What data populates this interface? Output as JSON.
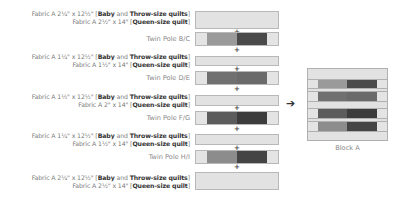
{
  "diagram": {
    "rows": [
      {
        "type": "fabric",
        "line1": {
          "prefix": "Fabric A 2¼\" x 12½\" [",
          "b1": "Baby",
          "mid": " and ",
          "b2": "Throw-size quilts",
          "suffix": "]"
        },
        "line2": {
          "prefix": "Fabric A 2½\" x 14\" [",
          "b1": "Queen-size quilt",
          "suffix": "]"
        }
      },
      {
        "type": "pole",
        "label": "Twin Pole B/C",
        "colors": {
          "mid": "#9a9a9a",
          "dark": "#4a4a4a"
        }
      },
      {
        "type": "fabric",
        "line1": {
          "prefix": "Fabric A 1¼\" x 12½\" [",
          "b1": "Baby",
          "mid": " and ",
          "b2": "Throw-size quilts",
          "suffix": "]"
        },
        "line2": {
          "prefix": "Fabric A 1½\" x 14\" [",
          "b1": "Queen-size quilt",
          "suffix": "]"
        }
      },
      {
        "type": "pole",
        "label": "Twin Pole D/E",
        "colors": {
          "mid": "#707070",
          "dark": "#6a6a6a"
        }
      },
      {
        "type": "fabric",
        "line1": {
          "prefix": "Fabric A 1½\" x 12½\" [",
          "b1": "Baby",
          "mid": " and ",
          "b2": "Throw-size quilts",
          "suffix": "]"
        },
        "line2": {
          "prefix": "Fabric A 2\" x 14\" [",
          "b1": "Queen-size quilt",
          "suffix": "]"
        }
      },
      {
        "type": "pole",
        "label": "Twin Pole F/G",
        "colors": {
          "mid": "#5c5c5c",
          "dark": "#3c3c3c"
        }
      },
      {
        "type": "fabric",
        "line1": {
          "prefix": "Fabric A 1¼\" x 12½\" [",
          "b1": "Baby",
          "mid": " and ",
          "b2": "Throw-size quilts",
          "suffix": "]"
        },
        "line2": {
          "prefix": "Fabric A 1½\" x 14\" [",
          "b1": "Queen-size quilt",
          "suffix": "]"
        }
      },
      {
        "type": "pole",
        "label": "Twin Pole H/I",
        "colors": {
          "mid": "#8c8c8c",
          "dark": "#444444"
        }
      },
      {
        "type": "fabric",
        "line1": {
          "prefix": "Fabric A 2¼\" x 12½\" [",
          "b1": "Baby",
          "mid": " and ",
          "b2": "Throw-size quilts",
          "suffix": "]"
        },
        "line2": {
          "prefix": "Fabric A 2½\" x 14\" [",
          "b1": "Queen-size quilt",
          "suffix": "]"
        }
      }
    ],
    "plus_symbol": "+",
    "arrow_symbol": "➔",
    "result_label": "Block A",
    "colors": {
      "fabric_a": "#e2e2e2",
      "outline": "#b8b8b8",
      "text": "#7a7a7a",
      "bold_text": "#333333"
    }
  }
}
